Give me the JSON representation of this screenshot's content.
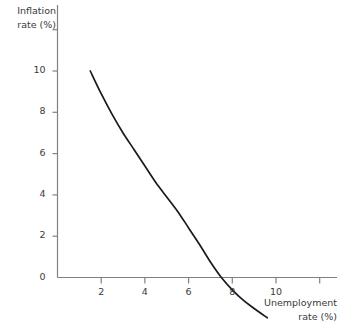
{
  "chart_data": {
    "type": "line",
    "title": "",
    "subtitle": "",
    "xlabel": "Unemployment rate (%)",
    "ylabel": "Inflation rate (%)",
    "xlim": [
      0,
      12.7
    ],
    "ylim": [
      -2.0,
      12.6
    ],
    "grid": false,
    "legend": null,
    "x_ticks": [
      {
        "value": 2,
        "label": "2"
      },
      {
        "value": 4,
        "label": "4"
      },
      {
        "value": 6,
        "label": "6"
      },
      {
        "value": 8,
        "label": "8"
      },
      {
        "value": 10,
        "label": "10"
      },
      {
        "value": 12,
        "label": ""
      }
    ],
    "y_ticks": [
      {
        "value": 0,
        "label": "0"
      },
      {
        "value": 2,
        "label": "2"
      },
      {
        "value": 4,
        "label": "4"
      },
      {
        "value": 6,
        "label": "6"
      },
      {
        "value": 8,
        "label": "8"
      },
      {
        "value": 10,
        "label": "10"
      },
      {
        "value": 12,
        "label": ""
      }
    ],
    "series": [
      {
        "name": "Phillips curve",
        "color": "#1a1a1a",
        "x": [
          1.5,
          2.0,
          2.5,
          3.0,
          3.5,
          4.0,
          4.5,
          5.0,
          5.5,
          6.0,
          6.5,
          7.0,
          7.5,
          8.0,
          8.5,
          9.0,
          9.6
        ],
        "y": [
          10.0,
          8.9,
          7.9,
          7.0,
          6.2,
          5.4,
          4.6,
          3.9,
          3.2,
          2.4,
          1.6,
          0.75,
          0.0,
          -0.6,
          -1.1,
          -1.5,
          -1.95
        ]
      }
    ],
    "annotations": [],
    "axis_color": "#808080",
    "text_color": "#3a3a3a"
  },
  "labels": {
    "y_title": "Inflation\nrate (%)",
    "x_title": "Unemployment\nrate (%)"
  }
}
